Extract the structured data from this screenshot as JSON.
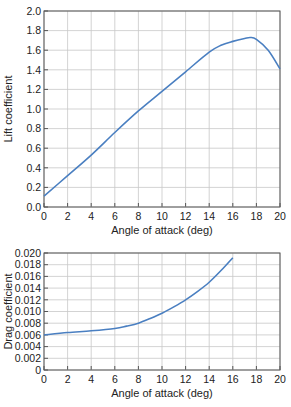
{
  "colors": {
    "curve": "#4a7fc1",
    "grid": "#c8c8c8",
    "axis": "#555555"
  },
  "chart_data": [
    {
      "type": "line",
      "title": "",
      "xlabel": "Angle of attack (deg)",
      "ylabel": "Lift coefficient",
      "xlim": [
        0,
        20
      ],
      "ylim": [
        0.0,
        2.0
      ],
      "xticks": [
        "0",
        "2",
        "4",
        "6",
        "8",
        "10",
        "12",
        "14",
        "16",
        "18",
        "20"
      ],
      "yticks": [
        "0.0",
        "0.2",
        "0.4",
        "0.6",
        "0.8",
        "1.0",
        "1.2",
        "1.4",
        "1.6",
        "1.8",
        "2.0"
      ],
      "grid": true,
      "legend": null,
      "series": [
        {
          "name": "Lift coefficient",
          "x": [
            0,
            2,
            4,
            6,
            8,
            10,
            12,
            14,
            15,
            16,
            17,
            17.5,
            18,
            19,
            20
          ],
          "y": [
            0.11,
            0.32,
            0.53,
            0.76,
            0.98,
            1.18,
            1.38,
            1.58,
            1.65,
            1.69,
            1.72,
            1.73,
            1.71,
            1.6,
            1.41
          ]
        }
      ]
    },
    {
      "type": "line",
      "title": "",
      "xlabel": "Angle of attack (deg)",
      "ylabel": "Drag coefficient",
      "xlim": [
        0,
        20
      ],
      "ylim": [
        0,
        0.02
      ],
      "xticks": [
        "0",
        "2",
        "4",
        "6",
        "8",
        "10",
        "12",
        "14",
        "16",
        "18",
        "20"
      ],
      "yticks": [
        "0",
        "0.002",
        "0.004",
        "0.006",
        "0.008",
        "0.010",
        "0.012",
        "0.014",
        "0.016",
        "0.018",
        "0.020"
      ],
      "grid": true,
      "legend": null,
      "series": [
        {
          "name": "Drag coefficient",
          "x": [
            0,
            2,
            4,
            6,
            7,
            8,
            9,
            10,
            11,
            12,
            13,
            14,
            15,
            16
          ],
          "y": [
            0.006,
            0.0064,
            0.0067,
            0.0071,
            0.0075,
            0.008,
            0.0088,
            0.0097,
            0.0108,
            0.012,
            0.0134,
            0.015,
            0.017,
            0.0192
          ]
        }
      ]
    }
  ]
}
